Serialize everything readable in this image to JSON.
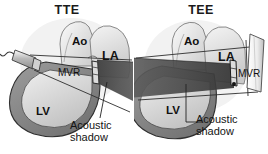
{
  "figure": {
    "title": "",
    "background_color": "#ffffff",
    "type": "medical-anatomical-diagram"
  },
  "panels": [
    {
      "id": "tte",
      "title": "TTE",
      "probe": {
        "name": "transthoracic-probe",
        "position": "upper-left-exterior",
        "has_cable": true
      },
      "shadow": {
        "label": "Acoustic\nshadow",
        "label_line1": "Acoustic",
        "label_line2": "shadow",
        "direction": "rightward-behind-valve",
        "obscures": "LA"
      },
      "structures": [
        {
          "name": "Ao",
          "label": "Ao",
          "full": "Aorta"
        },
        {
          "name": "LA",
          "label": "LA",
          "full": "Left atrium"
        },
        {
          "name": "LV",
          "label": "LV",
          "full": "Left ventricle"
        },
        {
          "name": "MVR",
          "label": "MVR",
          "full": "Mitral valve replacement"
        }
      ]
    },
    {
      "id": "tee",
      "title": "TEE",
      "probe": {
        "name": "transesophageal-probe",
        "position": "right-posterior",
        "has_cable": false
      },
      "shadow": {
        "label": "Acoustic\nshadow",
        "label_line1": "Acoustic",
        "label_line2": "shadow",
        "direction": "leftward-behind-valve",
        "obscures": "LV"
      },
      "structures": [
        {
          "name": "Ao",
          "label": "Ao",
          "full": "Aorta"
        },
        {
          "name": "LA",
          "label": "LA",
          "full": "Left atrium"
        },
        {
          "name": "LV",
          "label": "LV",
          "full": "Left ventricle"
        },
        {
          "name": "MVR",
          "label": "MVR",
          "full": "Mitral valve replacement"
        }
      ]
    }
  ],
  "colors": {
    "background": "#ffffff",
    "tissue_light": "#e8e8e8",
    "tissue_mid": "#bdbdbd",
    "myocardium": "#8a8a8a",
    "shadow_dark": "#4a4a4a",
    "shadow_darker": "#383838",
    "outline": "#2b2b2b",
    "text": "#111111"
  }
}
